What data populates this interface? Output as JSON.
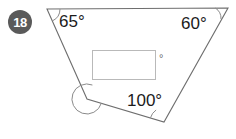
{
  "figure": {
    "problem_number": "18",
    "shape": "quadrilateral",
    "stroke_color": "#6e6e6e",
    "badge_color": "#5a5a5a",
    "box_border_color": "#b9b9b9",
    "vertices": [
      {
        "name": "top-left",
        "x": 47,
        "y": 9
      },
      {
        "name": "top-right",
        "x": 228,
        "y": 8
      },
      {
        "name": "bottom-right",
        "x": 164,
        "y": 122
      },
      {
        "name": "bottom-left",
        "x": 87,
        "y": 99
      }
    ],
    "angles": [
      {
        "name": "top-left",
        "label": "65°",
        "value": 65,
        "labeled": true
      },
      {
        "name": "top-right",
        "label": "60°",
        "value": 60,
        "labeled": true
      },
      {
        "name": "bottom-right",
        "label": "100°",
        "value": 100,
        "labeled": true
      },
      {
        "name": "bottom-left",
        "label": "",
        "value": null,
        "labeled": false
      }
    ],
    "answer_box": {
      "value": "",
      "placeholder": "",
      "unit_symbol": "°"
    }
  }
}
